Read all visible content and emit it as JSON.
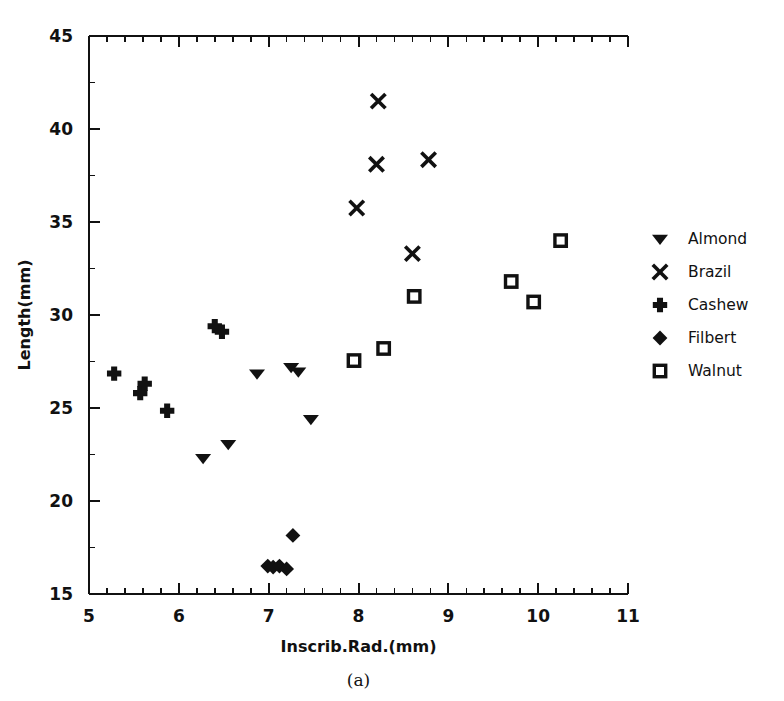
{
  "figure": {
    "caption": "(a)",
    "background": "#ffffff",
    "ink_color": "#111111"
  },
  "chart_data": {
    "type": "scatter",
    "title": "",
    "xlabel": "Inscrib.Rad.(mm)",
    "ylabel": "Length(mm)",
    "xlim": [
      5,
      11
    ],
    "ylim": [
      15,
      45
    ],
    "xticks": [
      5,
      6,
      7,
      8,
      9,
      10,
      11
    ],
    "yticks": [
      15,
      20,
      25,
      30,
      35,
      40,
      45
    ],
    "xtick_labels": [
      "5",
      "6",
      "7",
      "8",
      "9",
      "10",
      "11"
    ],
    "ytick_labels": [
      "15",
      "20",
      "25",
      "30",
      "35",
      "40",
      "45"
    ],
    "x_minor_interval": 0.2,
    "y_minor_interval": 2.5,
    "grid": false,
    "legend_position": "right",
    "series": [
      {
        "name": "Almond",
        "marker": "triangle-down",
        "filled": true,
        "points": [
          [
            6.27,
            22.3
          ],
          [
            6.55,
            23.05
          ],
          [
            6.87,
            26.85
          ],
          [
            7.25,
            27.2
          ],
          [
            7.33,
            26.95
          ],
          [
            7.47,
            24.4
          ]
        ]
      },
      {
        "name": "Brazil",
        "marker": "x-cross",
        "filled": true,
        "points": [
          [
            7.98,
            35.75
          ],
          [
            8.2,
            38.1
          ],
          [
            8.22,
            41.5
          ],
          [
            8.6,
            33.3
          ],
          [
            8.78,
            38.35
          ]
        ]
      },
      {
        "name": "Cashew",
        "marker": "plus",
        "filled": true,
        "points": [
          [
            5.28,
            26.85
          ],
          [
            5.57,
            25.8
          ],
          [
            5.62,
            26.3
          ],
          [
            5.87,
            24.85
          ],
          [
            6.4,
            29.4
          ],
          [
            6.48,
            29.1
          ]
        ]
      },
      {
        "name": "Filbert",
        "marker": "diamond",
        "filled": true,
        "points": [
          [
            6.99,
            16.5
          ],
          [
            7.05,
            16.45
          ],
          [
            7.12,
            16.5
          ],
          [
            7.2,
            16.35
          ],
          [
            7.27,
            18.15
          ]
        ]
      },
      {
        "name": "Walnut",
        "marker": "square-open",
        "filled": false,
        "points": [
          [
            7.95,
            27.55
          ],
          [
            8.28,
            28.2
          ],
          [
            8.62,
            31.0
          ],
          [
            9.7,
            31.8
          ],
          [
            9.95,
            30.7
          ],
          [
            10.25,
            34.0
          ]
        ]
      }
    ]
  },
  "legend": {
    "entries": [
      {
        "label": "Almond",
        "marker": "triangle-down"
      },
      {
        "label": "Brazil",
        "marker": "x-cross"
      },
      {
        "label": "Cashew",
        "marker": "plus"
      },
      {
        "label": "Filbert",
        "marker": "diamond"
      },
      {
        "label": "Walnut",
        "marker": "square-open"
      }
    ]
  }
}
